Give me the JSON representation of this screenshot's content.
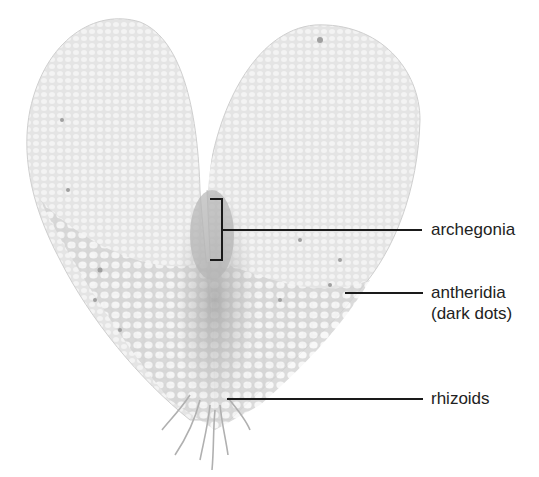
{
  "figure": {
    "colors": {
      "tissue_light": "#d6d6d6",
      "tissue_dark": "#b3b3b3",
      "leader_line": "#1a1a1a",
      "text": "#222222",
      "background": "#ffffff"
    }
  },
  "labels": [
    {
      "id": "archegonia",
      "text": "archegonia"
    },
    {
      "id": "antheridia",
      "text": "antheridia"
    },
    {
      "id": "antheridia_note",
      "text": "(dark dots)"
    },
    {
      "id": "rhizoids",
      "text": "rhizoids"
    }
  ]
}
